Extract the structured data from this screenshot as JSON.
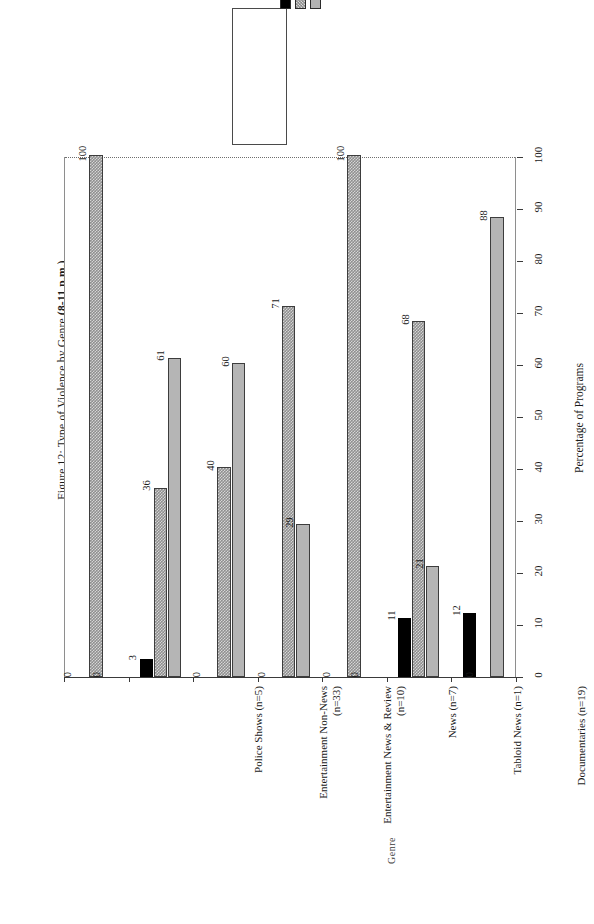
{
  "figure": {
    "title_prefix": "Figure 12: Type of Violence by Genre ",
    "title_bold": "(8-11 p.m.)"
  },
  "legend": {
    "items": [
      {
        "label": "Talk About Violence",
        "swatch": "black",
        "color": "#000000"
      },
      {
        "label": "Visual Violence",
        "swatch": "hatch",
        "color": "#8f8f8f"
      },
      {
        "label": "No Violence",
        "swatch": "grey",
        "color": "#b5b5b5"
      }
    ]
  },
  "axes": {
    "x_title": "Genre",
    "y_title": "Percentage of Programs",
    "y_ticks": [
      "0",
      "10",
      "20",
      "30",
      "40",
      "50",
      "60",
      "70",
      "80",
      "90",
      "100"
    ]
  },
  "page": {
    "number": ""
  },
  "chart_data": {
    "type": "bar",
    "title": "Figure 12: Type of Violence by Genre (8-11 p.m.)",
    "xlabel": "Genre",
    "ylabel": "Percentage of Programs",
    "ylim": [
      0,
      100
    ],
    "ytick_step": 10,
    "grid": true,
    "legend_position": "top-center",
    "orientation": "vertical-bars-page-rotated-90",
    "categories": [
      "Police Shows (n=5)",
      "Entertainment Non-News\n(n=33)",
      "Entertainment News & Review\n(n=10)",
      "News (n=7)",
      "Tabloid News (n=1)",
      "Documentaries (n=19)",
      "Talk Shows (n=8)"
    ],
    "series": [
      {
        "name": "Talk About Violence",
        "color": "#000000",
        "values": [
          0,
          3,
          0,
          0,
          0,
          11,
          12
        ]
      },
      {
        "name": "Visual Violence",
        "color": "#8f8f8f",
        "values": [
          100,
          36,
          40,
          71,
          100,
          68,
          0
        ]
      },
      {
        "name": "No Violence",
        "color": "#b5b5b5",
        "values": [
          0,
          61,
          60,
          29,
          0,
          21,
          88
        ]
      }
    ]
  }
}
